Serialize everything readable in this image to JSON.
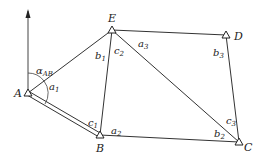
{
  "diagram": {
    "type": "traverse-survey-network",
    "north_arrow": {
      "x": 28,
      "y_top": 10,
      "y_bottom": 93
    },
    "points": [
      {
        "id": "A",
        "label": "A",
        "x": 28,
        "y": 93
      },
      {
        "id": "E",
        "label": "E",
        "x": 112,
        "y": 30
      },
      {
        "id": "D",
        "label": "D",
        "x": 226,
        "y": 35
      },
      {
        "id": "B",
        "label": "B",
        "x": 100,
        "y": 135
      },
      {
        "id": "C",
        "label": "C",
        "x": 239,
        "y": 142
      }
    ],
    "edges": [
      {
        "from": "A",
        "to": "E",
        "style": "single"
      },
      {
        "from": "A",
        "to": "B",
        "style": "double"
      },
      {
        "from": "E",
        "to": "D",
        "style": "single"
      },
      {
        "from": "E",
        "to": "B",
        "style": "single"
      },
      {
        "from": "E",
        "to": "C",
        "style": "single"
      },
      {
        "from": "D",
        "to": "C",
        "style": "single"
      },
      {
        "from": "B",
        "to": "C",
        "style": "single"
      }
    ],
    "angle_labels": [
      {
        "main": "α",
        "sub": "AB",
        "x": 23,
        "y": 72
      },
      {
        "main": "a",
        "sub": "1",
        "x": 46,
        "y": 90
      },
      {
        "main": "b",
        "sub": "1",
        "x": 94,
        "y": 58
      },
      {
        "main": "c",
        "sub": "2",
        "x": 114,
        "y": 55
      },
      {
        "main": "a",
        "sub": "3",
        "x": 138,
        "y": 46
      },
      {
        "main": "b",
        "sub": "3",
        "x": 210,
        "y": 54
      },
      {
        "main": "c",
        "sub": "1",
        "x": 86,
        "y": 125
      },
      {
        "main": "a",
        "sub": "2",
        "x": 110,
        "y": 133
      },
      {
        "main": "b",
        "sub": "2",
        "x": 213,
        "y": 137
      },
      {
        "main": "c",
        "sub": "3",
        "x": 224,
        "y": 124
      }
    ]
  }
}
